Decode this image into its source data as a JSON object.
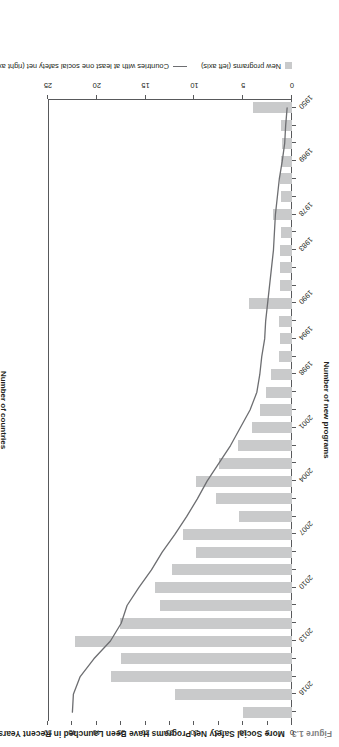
{
  "figure": {
    "number": "Figure 1.3",
    "title": "More Social Safety Net Programs Have Been Launched in Recent Years"
  },
  "legend": {
    "bar_label": "New programs (left axis)",
    "line_label": "Countries with at least one social safety net (right axis)"
  },
  "chart_data": {
    "type": "bar",
    "title": "More Social Safety Net Programs Have Been Launched in Recent Years",
    "xlabel": "",
    "ylabel": "Number of new programs",
    "y2label": "Number of countries",
    "ylim": [
      0,
      25
    ],
    "y2lim": [
      0,
      50
    ],
    "grid": false,
    "legend_position": "bottom-left",
    "x_tick_labels": [
      "1950",
      "1969",
      "1978",
      "1983",
      "1990",
      "1994",
      "1998",
      "2001",
      "2004",
      "2007",
      "2010",
      "2013",
      "2016"
    ],
    "y_tick_labels": [
      "0",
      "5",
      "10",
      "15",
      "20",
      "25"
    ],
    "y2_tick_labels": [
      "0",
      "5",
      "10",
      "15",
      "20",
      "25",
      "30",
      "35",
      "40",
      "45",
      "50"
    ],
    "categories": [
      "1950",
      "1960",
      "1965",
      "1969",
      "1972",
      "1975",
      "1978",
      "1980",
      "1983",
      "1985",
      "1988",
      "1990",
      "1992",
      "1994",
      "1996",
      "1998",
      "1999",
      "2000",
      "2001",
      "2002",
      "2003",
      "2004",
      "2005",
      "2006",
      "2007",
      "2008",
      "2009",
      "2010",
      "2011",
      "2012",
      "2013",
      "2014",
      "2015",
      "2016",
      "2017"
    ],
    "series": [
      {
        "name": "New programs (left axis)",
        "type": "bar",
        "axis": "left",
        "color": "#c9cacb",
        "values": [
          4.0,
          1.1,
          1.0,
          1.1,
          1.2,
          1.1,
          1.9,
          1.1,
          1.2,
          1.2,
          1.2,
          4.4,
          1.3,
          1.2,
          1.3,
          2.2,
          2.7,
          3.3,
          4.1,
          5.5,
          7.5,
          9.8,
          7.8,
          5.4,
          11.2,
          9.8,
          12.3,
          14.0,
          13.5,
          17.6,
          22.2,
          17.5,
          18.5,
          12.0,
          5.0
        ]
      },
      {
        "name": "Countries with at least one social safety net (right axis)",
        "type": "line",
        "axis": "right",
        "color": "#6d6e71",
        "values": [
          1.0,
          1.3,
          1.5,
          2.0,
          2.6,
          3.0,
          3.4,
          3.6,
          3.8,
          4.2,
          4.6,
          5.0,
          5.4,
          5.6,
          6.2,
          6.6,
          7.2,
          8.6,
          10.6,
          12.6,
          15.0,
          17.4,
          19.4,
          21.6,
          24.0,
          26.6,
          28.8,
          31.4,
          33.8,
          35.0,
          37.2,
          40.6,
          43.4,
          44.8,
          45.0
        ]
      }
    ]
  },
  "axes": {
    "left_title": "Number of new programs",
    "right_title": "Number of countries"
  }
}
